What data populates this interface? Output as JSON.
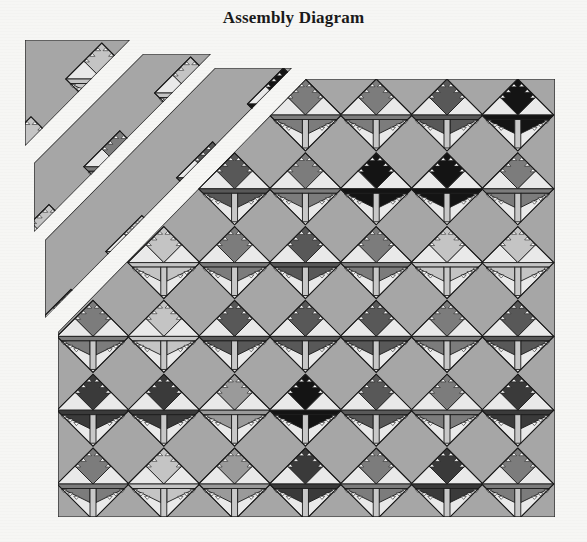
{
  "title": "Assembly Diagram",
  "colors": {
    "background_fill": "#a6a6a6",
    "light": "#e9e9e9",
    "outline": "#1c1c1c",
    "trunk": "#c8c8c8",
    "shades": {
      "black": "#141414",
      "dark": "#3a3a3a",
      "darkmed": "#585858",
      "med": "#7c7c7c",
      "lightmed": "#9a9a9a",
      "light": "#c4c4c4"
    }
  },
  "geometry": {
    "half_diagonal": 36,
    "col_x0": 93,
    "col_dx": 70.8,
    "row_y0": 115,
    "row_dy": 73.8
  },
  "pieces": [
    {
      "name": "main-quilt-body",
      "polygon": [
        [
          306,
          79
        ],
        [
          555,
          79
        ],
        [
          555,
          517
        ],
        [
          58,
          517
        ],
        [
          58,
          332
        ]
      ],
      "offset": [
        0,
        0
      ],
      "trees": [
        [
          0,
          3,
          "med"
        ],
        [
          0,
          4,
          "med"
        ],
        [
          0,
          5,
          "darkmed"
        ],
        [
          0,
          6,
          "black"
        ],
        [
          1,
          2,
          "darkmed"
        ],
        [
          1,
          3,
          "med"
        ],
        [
          1,
          4,
          "black"
        ],
        [
          1,
          5,
          "black"
        ],
        [
          1,
          6,
          "med"
        ],
        [
          2,
          1,
          "light"
        ],
        [
          2,
          2,
          "med"
        ],
        [
          2,
          3,
          "darkmed"
        ],
        [
          2,
          4,
          "med"
        ],
        [
          2,
          5,
          "light"
        ],
        [
          2,
          6,
          "light"
        ],
        [
          3,
          0,
          "med"
        ],
        [
          3,
          1,
          "light"
        ],
        [
          3,
          2,
          "darkmed"
        ],
        [
          3,
          3,
          "darkmed"
        ],
        [
          3,
          4,
          "darkmed"
        ],
        [
          3,
          5,
          "med"
        ],
        [
          3,
          6,
          "darkmed"
        ],
        [
          4,
          0,
          "dark"
        ],
        [
          4,
          1,
          "dark"
        ],
        [
          4,
          2,
          "lightmed"
        ],
        [
          4,
          3,
          "black"
        ],
        [
          4,
          4,
          "darkmed"
        ],
        [
          4,
          5,
          "med"
        ],
        [
          4,
          6,
          "dark"
        ],
        [
          5,
          0,
          "med"
        ],
        [
          5,
          1,
          "light"
        ],
        [
          5,
          2,
          "lightmed"
        ],
        [
          5,
          3,
          "dark"
        ],
        [
          5,
          4,
          "med"
        ],
        [
          5,
          5,
          "dark"
        ],
        [
          5,
          6,
          "med"
        ]
      ]
    },
    {
      "name": "diagonal-strip-3",
      "polygon": [
        [
          215,
          68
        ],
        [
          292,
          68
        ],
        [
          45,
          318
        ],
        [
          45,
          240
        ]
      ],
      "offset": [
        -22,
        -11
      ],
      "trees": [
        [
          0,
          3,
          "black"
        ],
        [
          1,
          2,
          "darkmed"
        ],
        [
          2,
          1,
          "light"
        ],
        [
          3,
          0,
          "darkmed"
        ],
        [
          1,
          3,
          "light"
        ],
        [
          2,
          2,
          "light"
        ],
        [
          3,
          1,
          "light"
        ]
      ]
    },
    {
      "name": "diagonal-strip-2",
      "polygon": [
        [
          143,
          54
        ],
        [
          211,
          54
        ],
        [
          34,
          232
        ],
        [
          34,
          163
        ]
      ],
      "offset": [
        -44,
        -22
      ],
      "trees": [
        [
          0,
          2,
          "light"
        ],
        [
          1,
          1,
          "med"
        ],
        [
          2,
          0,
          "light"
        ],
        [
          1,
          2,
          "darkmed"
        ]
      ]
    },
    {
      "name": "diagonal-strip-1",
      "polygon": [
        [
          25,
          40
        ],
        [
          130,
          40
        ],
        [
          25,
          146
        ]
      ],
      "offset": [
        -62,
        -36
      ],
      "trees": [
        [
          0,
          1,
          "light"
        ],
        [
          1,
          0,
          "light"
        ]
      ]
    }
  ]
}
